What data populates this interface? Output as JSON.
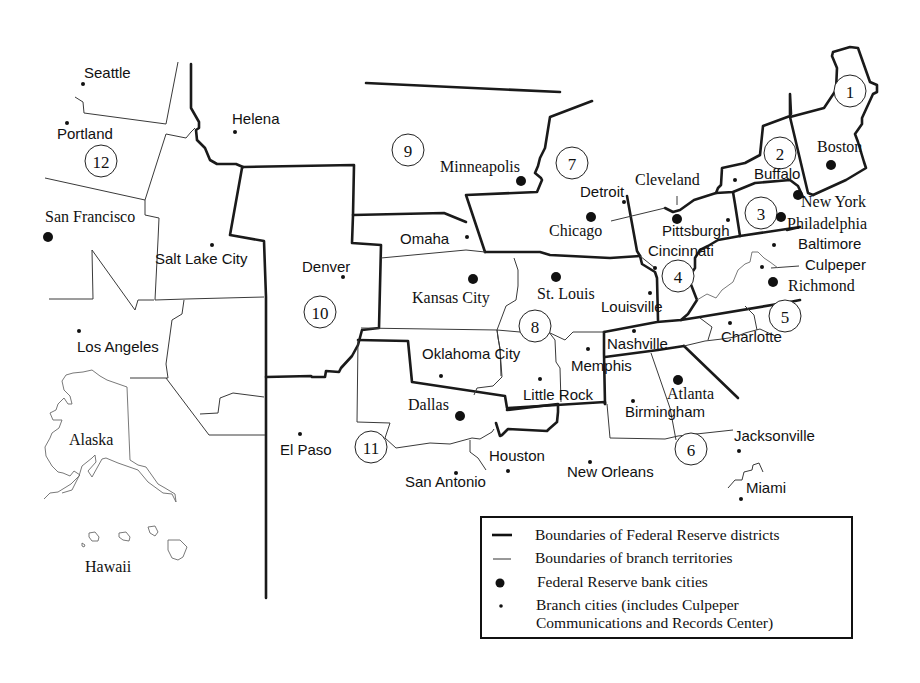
{
  "map": {
    "title": "Federal Reserve Districts",
    "districts": [
      {
        "number": "1",
        "x": 850,
        "y": 91
      },
      {
        "number": "2",
        "x": 780,
        "y": 153
      },
      {
        "number": "3",
        "x": 761,
        "y": 213
      },
      {
        "number": "4",
        "x": 678,
        "y": 276
      },
      {
        "number": "5",
        "x": 785,
        "y": 316
      },
      {
        "number": "6",
        "x": 691,
        "y": 449
      },
      {
        "number": "7",
        "x": 572,
        "y": 163
      },
      {
        "number": "8",
        "x": 535,
        "y": 326
      },
      {
        "number": "9",
        "x": 408,
        "y": 150
      },
      {
        "number": "10",
        "x": 320,
        "y": 312
      },
      {
        "number": "11",
        "x": 371,
        "y": 447
      },
      {
        "number": "12",
        "x": 101,
        "y": 161
      }
    ],
    "bank_cities": [
      {
        "name": "Boston",
        "dot_x": 831,
        "dot_y": 165,
        "lbl_x": 817,
        "lbl_y": 152,
        "style": "serif"
      },
      {
        "name": "New York",
        "dot_x": 798,
        "dot_y": 195,
        "lbl_x": 801,
        "lbl_y": 207,
        "style": "serif"
      },
      {
        "name": "Philadelphia",
        "dot_x": 781,
        "dot_y": 217,
        "lbl_x": 787,
        "lbl_y": 229,
        "style": "serif"
      },
      {
        "name": "Cleveland",
        "dot_x": 677,
        "dot_y": 219,
        "lbl_x": 635,
        "lbl_y": 185,
        "style": "serif"
      },
      {
        "name": "Richmond",
        "dot_x": 773,
        "dot_y": 282,
        "lbl_x": 788,
        "lbl_y": 291,
        "style": "serif"
      },
      {
        "name": "Atlanta",
        "dot_x": 678,
        "dot_y": 380,
        "lbl_x": 667,
        "lbl_y": 399,
        "style": "serif"
      },
      {
        "name": "Chicago",
        "dot_x": 591,
        "dot_y": 217,
        "lbl_x": 549,
        "lbl_y": 236,
        "style": "serif"
      },
      {
        "name": "St. Louis",
        "dot_x": 556,
        "dot_y": 277,
        "lbl_x": 537,
        "lbl_y": 299,
        "style": "serif"
      },
      {
        "name": "Minneapolis",
        "dot_x": 521,
        "dot_y": 181,
        "lbl_x": 440,
        "lbl_y": 172,
        "style": "serif"
      },
      {
        "name": "Kansas City",
        "dot_x": 473,
        "dot_y": 279,
        "lbl_x": 412,
        "lbl_y": 303,
        "style": "serif"
      },
      {
        "name": "Dallas",
        "dot_x": 460,
        "dot_y": 416,
        "lbl_x": 408,
        "lbl_y": 410,
        "style": "serif"
      },
      {
        "name": "San Francisco",
        "dot_x": 48,
        "dot_y": 237,
        "lbl_x": 45,
        "lbl_y": 222,
        "style": "serif"
      }
    ],
    "branch_cities": [
      {
        "name": "Seattle",
        "dot_x": 83,
        "dot_y": 84,
        "lbl_x": 84,
        "lbl_y": 78
      },
      {
        "name": "Portland",
        "dot_x": 67,
        "dot_y": 123,
        "lbl_x": 57,
        "lbl_y": 139
      },
      {
        "name": "Helena",
        "dot_x": 235,
        "dot_y": 132,
        "lbl_x": 232,
        "lbl_y": 124
      },
      {
        "name": "Salt Lake City",
        "dot_x": 212,
        "dot_y": 245,
        "lbl_x": 155,
        "lbl_y": 264
      },
      {
        "name": "Los Angeles",
        "dot_x": 79,
        "dot_y": 331,
        "lbl_x": 77,
        "lbl_y": 352
      },
      {
        "name": "Denver",
        "dot_x": 343,
        "dot_y": 277,
        "lbl_x": 302,
        "lbl_y": 272
      },
      {
        "name": "Omaha",
        "dot_x": 467,
        "dot_y": 237,
        "lbl_x": 400,
        "lbl_y": 244
      },
      {
        "name": "Detroit",
        "dot_x": 624,
        "dot_y": 202,
        "lbl_x": 580,
        "lbl_y": 197
      },
      {
        "name": "Buffalo",
        "dot_x": 735,
        "dot_y": 180,
        "lbl_x": 754,
        "lbl_y": 179
      },
      {
        "name": "Pittsburgh",
        "dot_x": 728,
        "dot_y": 220,
        "lbl_x": 662,
        "lbl_y": 236
      },
      {
        "name": "Cincinnati",
        "dot_x": 655,
        "dot_y": 268,
        "lbl_x": 648,
        "lbl_y": 256
      },
      {
        "name": "Baltimore",
        "dot_x": 774,
        "dot_y": 245,
        "lbl_x": 798,
        "lbl_y": 249
      },
      {
        "name": "Culpeper",
        "dot_x": 762,
        "dot_y": 267,
        "lbl_x": 805,
        "lbl_y": 270
      },
      {
        "name": "Louisville",
        "dot_x": 650,
        "dot_y": 293,
        "lbl_x": 601,
        "lbl_y": 312
      },
      {
        "name": "Charlotte",
        "dot_x": 730,
        "dot_y": 323,
        "lbl_x": 721,
        "lbl_y": 342
      },
      {
        "name": "Nashville",
        "dot_x": 634,
        "dot_y": 331,
        "lbl_x": 607,
        "lbl_y": 349
      },
      {
        "name": "Memphis",
        "dot_x": 588,
        "dot_y": 349,
        "lbl_x": 571,
        "lbl_y": 371
      },
      {
        "name": "Oklahoma City",
        "dot_x": 441,
        "dot_y": 376,
        "lbl_x": 422,
        "lbl_y": 359
      },
      {
        "name": "Little Rock",
        "dot_x": 540,
        "dot_y": 379,
        "lbl_x": 523,
        "lbl_y": 400
      },
      {
        "name": "Birmingham",
        "dot_x": 633,
        "dot_y": 401,
        "lbl_x": 625,
        "lbl_y": 417
      },
      {
        "name": "Jacksonville",
        "dot_x": 739,
        "dot_y": 451,
        "lbl_x": 734,
        "lbl_y": 441
      },
      {
        "name": "Miami",
        "dot_x": 741,
        "dot_y": 499,
        "lbl_x": 746,
        "lbl_y": 493
      },
      {
        "name": "New Orleans",
        "dot_x": 590,
        "dot_y": 462,
        "lbl_x": 567,
        "lbl_y": 477
      },
      {
        "name": "Houston",
        "dot_x": 508,
        "dot_y": 471,
        "lbl_x": 489,
        "lbl_y": 461
      },
      {
        "name": "San Antonio",
        "dot_x": 456,
        "dot_y": 473,
        "lbl_x": 405,
        "lbl_y": 487
      },
      {
        "name": "El Paso",
        "dot_x": 300,
        "dot_y": 434,
        "lbl_x": 280,
        "lbl_y": 455
      }
    ],
    "region_labels": [
      {
        "name": "Alaska",
        "x": 69,
        "y": 445
      },
      {
        "name": "Hawaii",
        "x": 85,
        "y": 572
      }
    ]
  },
  "legend": {
    "items": [
      {
        "symbol": "thick-line",
        "label": "Boundaries of Federal Reserve districts"
      },
      {
        "symbol": "thin-line",
        "label": "Boundaries of branch territories"
      },
      {
        "symbol": "large-dot",
        "label": "Federal Reserve bank cities"
      },
      {
        "symbol": "small-dot",
        "label": "Branch cities (includes Culpeper",
        "label_line2": "Communications and Records Center)"
      }
    ]
  },
  "colors": {
    "ink": "#111111",
    "background": "#ffffff",
    "outline_gray": "#6a6a6a"
  }
}
